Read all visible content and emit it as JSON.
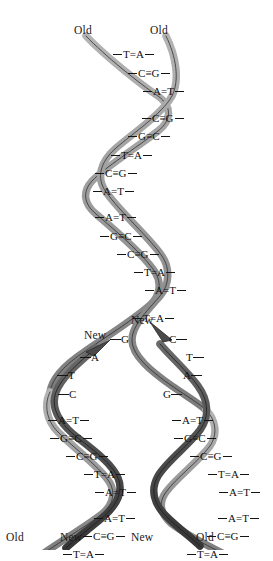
{
  "figure": {
    "width": 273,
    "height": 550,
    "background": "#ffffff"
  },
  "colors": {
    "old_strand": "#9a9a9a",
    "old_strand_shade": "#7b7b7b",
    "new_strand": "#4f4f4f",
    "new_strand_shade": "#3a3a3a",
    "outline": "#2b2b2b",
    "text": "#101010"
  },
  "labels": {
    "top": [
      {
        "text": "Old",
        "x": 74,
        "y": 25
      },
      {
        "text": "Old",
        "x": 150,
        "y": 25
      }
    ],
    "bottom": [
      {
        "text": "Old",
        "x": 6,
        "y": 532
      },
      {
        "text": "New",
        "x": 60,
        "y": 532
      },
      {
        "text": "New",
        "x": 131,
        "y": 532
      },
      {
        "text": "Old",
        "x": 196,
        "y": 532
      }
    ],
    "fork": [
      {
        "text": "New",
        "x": 84,
        "y": 330
      },
      {
        "text": "New",
        "x": 131,
        "y": 315
      }
    ]
  },
  "parent_helix": {
    "name": "parent-duplex",
    "base_pairs": [
      {
        "left": "T",
        "bond": "=",
        "right": "A",
        "x": 113,
        "y": 49
      },
      {
        "left": "C",
        "bond": "≡",
        "right": "G",
        "x": 128,
        "y": 68
      },
      {
        "left": "A",
        "bond": "=",
        "right": "T",
        "x": 143,
        "y": 86
      },
      {
        "left": "C",
        "bond": "≡",
        "right": "G",
        "x": 142,
        "y": 113
      },
      {
        "left": "G",
        "bond": "≡",
        "right": "C",
        "x": 128,
        "y": 131
      },
      {
        "left": "T",
        "bond": "=",
        "right": "A",
        "x": 111,
        "y": 150
      },
      {
        "left": "C",
        "bond": "≡",
        "right": "G",
        "x": 95,
        "y": 168
      },
      {
        "left": "A",
        "bond": "=",
        "right": "T",
        "x": 93,
        "y": 186
      },
      {
        "left": "A",
        "bond": "=",
        "right": "T",
        "x": 95,
        "y": 212
      },
      {
        "left": "G",
        "bond": "≡",
        "right": "C",
        "x": 100,
        "y": 231
      },
      {
        "left": "C",
        "bond": "≡",
        "right": "G",
        "x": 117,
        "y": 249
      },
      {
        "left": "T",
        "bond": "=",
        "right": "A",
        "x": 134,
        "y": 267
      },
      {
        "left": "A",
        "bond": "=",
        "right": "T",
        "x": 145,
        "y": 285
      },
      {
        "left": "T",
        "bond": "=",
        "right": "A",
        "x": 133,
        "y": 313
      }
    ]
  },
  "fork_unpaired": {
    "left_template": [
      {
        "base": "G",
        "x": 110,
        "y": 334
      },
      {
        "base": "A",
        "x": 80,
        "y": 352
      },
      {
        "base": "T",
        "x": 57,
        "y": 370
      },
      {
        "base": "C",
        "x": 58,
        "y": 389
      }
    ],
    "right_template": [
      {
        "base": "C",
        "x": 169,
        "y": 334
      },
      {
        "base": "T",
        "x": 186,
        "y": 352
      },
      {
        "base": "A",
        "x": 183,
        "y": 370
      },
      {
        "base": "G",
        "x": 163,
        "y": 389
      }
    ]
  },
  "daughter_left": {
    "name": "daughter-duplex-left",
    "base_pairs": [
      {
        "left": "A",
        "bond": "=",
        "right": "T",
        "x": 48,
        "y": 415
      },
      {
        "left": "G",
        "bond": "≡",
        "right": "C",
        "x": 50,
        "y": 433
      },
      {
        "left": "C",
        "bond": "≡",
        "right": "G",
        "x": 66,
        "y": 451
      },
      {
        "left": "T",
        "bond": "=",
        "right": "A",
        "x": 84,
        "y": 469
      },
      {
        "left": "A",
        "bond": "=",
        "right": "T",
        "x": 95,
        "y": 487
      },
      {
        "left": "A",
        "bond": "=",
        "right": "T",
        "x": 94,
        "y": 513
      },
      {
        "left": "C",
        "bond": "≡",
        "right": "G",
        "x": 83,
        "y": 531
      },
      {
        "left": "T",
        "bond": "=",
        "right": "A",
        "x": 63,
        "y": 549
      },
      {
        "left": "G",
        "bond": "≡",
        "right": "C",
        "x": 47,
        "y": 567
      },
      {
        "left": "A",
        "bond": "=",
        "right": "T",
        "x": 33,
        "y": 585
      }
    ]
  },
  "daughter_right": {
    "name": "daughter-duplex-right",
    "base_pairs": [
      {
        "left": "A",
        "bond": "=",
        "right": "T",
        "x": 172,
        "y": 415
      },
      {
        "left": "G",
        "bond": "≡",
        "right": "C",
        "x": 174,
        "y": 433
      },
      {
        "left": "C",
        "bond": "≡",
        "right": "G",
        "x": 190,
        "y": 451
      },
      {
        "left": "T",
        "bond": "=",
        "right": "A",
        "x": 208,
        "y": 469
      },
      {
        "left": "A",
        "bond": "=",
        "right": "T",
        "x": 219,
        "y": 487
      },
      {
        "left": "A",
        "bond": "=",
        "right": "T",
        "x": 218,
        "y": 513
      },
      {
        "left": "C",
        "bond": "≡",
        "right": "G",
        "x": 207,
        "y": 531
      },
      {
        "left": "T",
        "bond": "=",
        "right": "A",
        "x": 187,
        "y": 549
      },
      {
        "left": "G",
        "bond": "≡",
        "right": "C",
        "x": 171,
        "y": 567
      },
      {
        "left": "A",
        "bond": "=",
        "right": "T",
        "x": 157,
        "y": 585
      }
    ]
  }
}
